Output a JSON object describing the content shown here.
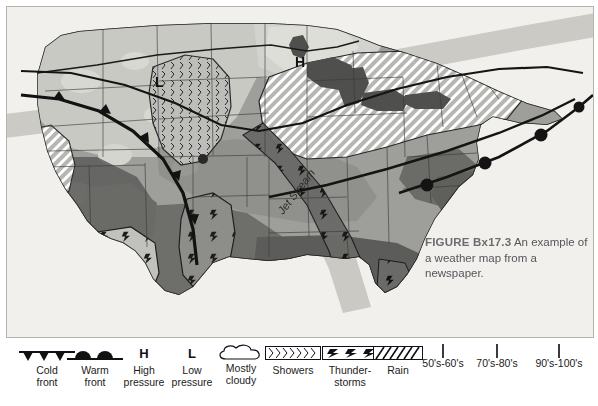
{
  "figure": {
    "caption_lead": "FIGURE Bx17.3",
    "caption_text": "An example of a weather map from a newspaper."
  },
  "map": {
    "labels": [
      {
        "text": "H",
        "name": "high-pressure-marker-north"
      },
      {
        "text": "L",
        "name": "low-pressure-marker-west"
      },
      {
        "text": "Jet Stream",
        "name": "jet-stream-label"
      }
    ],
    "high_pressure_label": "H",
    "low_pressure_label": "L",
    "jet_stream_label": "Jet Stream",
    "colors": {
      "ocean": "#ffffff",
      "backdrop": "#f2f0ec",
      "temp_50s_60s": "#c9c9c4",
      "temp_70s_80s": "#8d8d8a",
      "temp_90s_100s": "#5c5c5a",
      "lake": "#4f4f4d",
      "border": "#2a2a2a",
      "front_line": "#111111",
      "jet_stream_band": "#b0aeab"
    }
  },
  "legend": {
    "title": "Weather map legend",
    "items": [
      {
        "name": "cold-front",
        "icon": "cold-front-icon",
        "label": "Cold\nfront"
      },
      {
        "name": "warm-front",
        "icon": "warm-front-icon",
        "label": "Warm\nfront"
      },
      {
        "name": "high-pressure",
        "icon": "letter-h-icon",
        "label": "High\npressure",
        "glyph": "H"
      },
      {
        "name": "low-pressure",
        "icon": "letter-l-icon",
        "label": "Low\npressure",
        "glyph": "L"
      },
      {
        "name": "mostly-cloudy",
        "icon": "cloud-icon",
        "label": "Mostly\ncloudy"
      },
      {
        "name": "showers",
        "icon": "showers-hatch-icon",
        "label": "Showers"
      },
      {
        "name": "thunderstorms",
        "icon": "lightning-hatch-icon",
        "label": "Thunder-\nstorms"
      },
      {
        "name": "rain",
        "icon": "rain-hatch-icon",
        "label": "Rain"
      },
      {
        "name": "temp-50-60",
        "icon": "swatch-light-icon",
        "label": "50's-60's",
        "color": "#c9c9c4"
      },
      {
        "name": "temp-70-80",
        "icon": "swatch-medium-icon",
        "label": "70's-80's",
        "color": "#8d8d8a"
      },
      {
        "name": "temp-90-100",
        "icon": "swatch-dark-icon",
        "label": "90's-100's",
        "color": "#5c5c5a"
      }
    ]
  }
}
